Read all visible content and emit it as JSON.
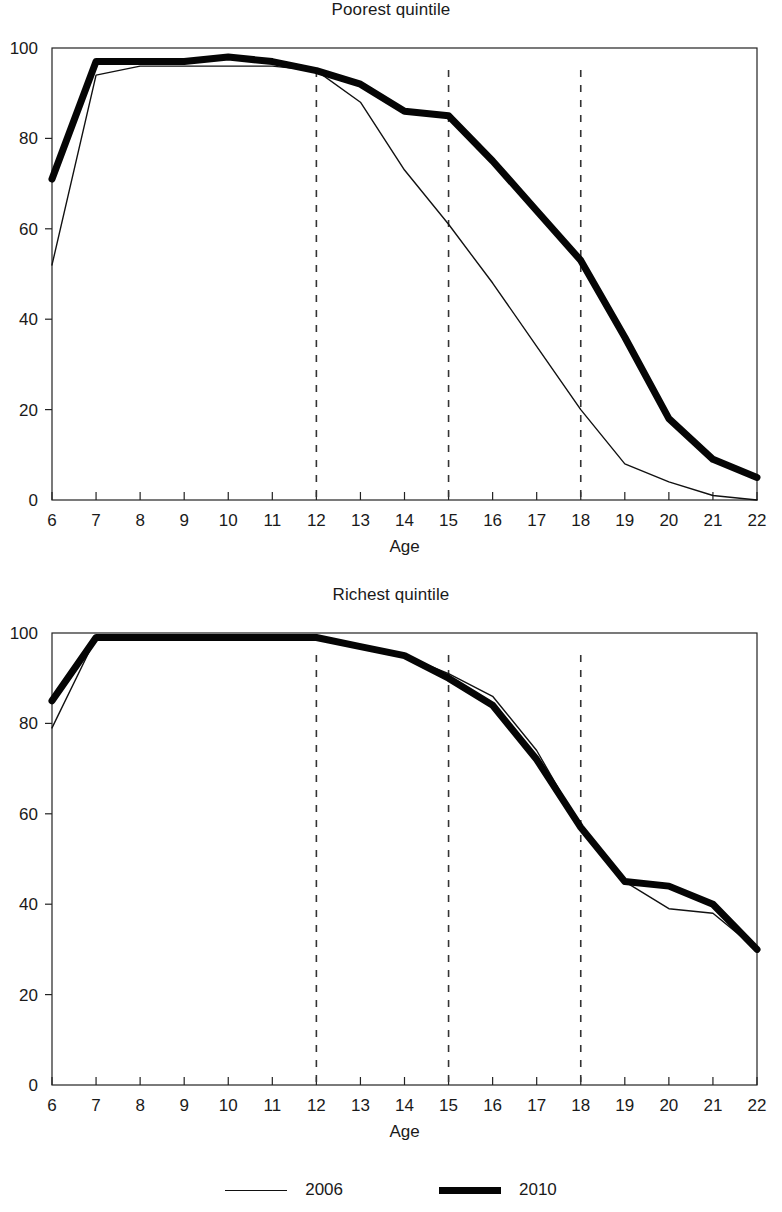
{
  "legend": {
    "items": [
      {
        "label": "2006",
        "style": "thin",
        "color": "#111111"
      },
      {
        "label": "2010",
        "style": "thick",
        "color": "#050505"
      }
    ]
  },
  "panels": [
    {
      "id": "poorest",
      "title": "Poorest quintile"
    },
    {
      "id": "richest",
      "title": "Richest quintile"
    }
  ],
  "axis": {
    "xlabel": "Age",
    "xticks": [
      "6",
      "7",
      "8",
      "9",
      "10",
      "11",
      "12",
      "13",
      "14",
      "15",
      "16",
      "17",
      "18",
      "19",
      "20",
      "21",
      "22"
    ],
    "yticks": [
      "0",
      "20",
      "40",
      "60",
      "80",
      "100"
    ]
  },
  "chart_data": [
    {
      "type": "line",
      "title": "Poorest quintile",
      "xlabel": "Age",
      "ylabel": "",
      "x": [
        6,
        7,
        8,
        9,
        10,
        11,
        12,
        13,
        14,
        15,
        16,
        17,
        18,
        19,
        20,
        21,
        22
      ],
      "xlim": [
        6,
        22
      ],
      "ylim": [
        0,
        100
      ],
      "grid": false,
      "legend_position": "bottom",
      "reference_lines": {
        "vertical_dashed_x": [
          12,
          15,
          18
        ]
      },
      "series": [
        {
          "name": "2006",
          "style": "thin",
          "values": [
            52,
            94,
            96,
            96,
            96,
            96,
            95,
            88,
            73,
            61,
            48,
            34,
            20,
            8,
            4,
            1,
            0
          ]
        },
        {
          "name": "2010",
          "style": "thick",
          "values": [
            71,
            97,
            97,
            97,
            98,
            97,
            95,
            92,
            86,
            85,
            75,
            64,
            53,
            36,
            18,
            9,
            5
          ]
        }
      ]
    },
    {
      "type": "line",
      "title": "Richest quintile",
      "xlabel": "Age",
      "ylabel": "",
      "x": [
        6,
        7,
        8,
        9,
        10,
        11,
        12,
        13,
        14,
        15,
        16,
        17,
        18,
        19,
        20,
        21,
        22
      ],
      "xlim": [
        6,
        22
      ],
      "ylim": [
        0,
        100
      ],
      "grid": false,
      "legend_position": "bottom",
      "reference_lines": {
        "vertical_dashed_x": [
          12,
          15,
          18
        ]
      },
      "series": [
        {
          "name": "2006",
          "style": "thin",
          "values": [
            79,
            99,
            99,
            99,
            99,
            99,
            99,
            97,
            95,
            91,
            86,
            74,
            57,
            45,
            39,
            38,
            30
          ]
        },
        {
          "name": "2010",
          "style": "thick",
          "values": [
            85,
            99,
            99,
            99,
            99,
            99,
            99,
            97,
            95,
            90,
            84,
            72,
            57,
            45,
            44,
            40,
            30
          ]
        }
      ]
    }
  ]
}
